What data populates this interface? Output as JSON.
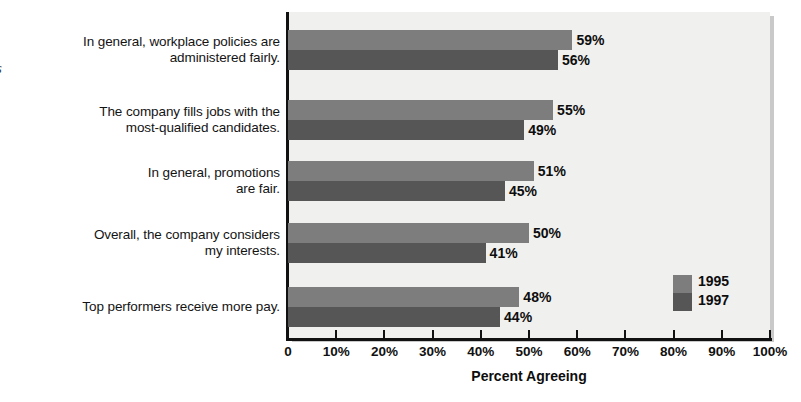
{
  "chart_data": {
    "type": "bar",
    "orientation": "horizontal",
    "title": "",
    "xlabel": "Percent Agreeing",
    "ylabel": "",
    "xlim": [
      0,
      100
    ],
    "grid": false,
    "legend_position": "inside-bottom-right",
    "categories": [
      "In general, workplace policies are administered fairly.",
      "The company fills jobs with the most-qualified candidates.",
      "In general, promotions are fair.",
      "Overall, the company considers my interests.",
      "Top performers receive more pay."
    ],
    "series": [
      {
        "name": "1995",
        "color": "#7d7d7d",
        "values": [
          59,
          55,
          51,
          50,
          48
        ]
      },
      {
        "name": "1997",
        "color": "#565656",
        "values": [
          56,
          49,
          45,
          41,
          44
        ]
      }
    ],
    "value_labels": [
      [
        "59%",
        "55%",
        "51%",
        "50%",
        "48%"
      ],
      [
        "56%",
        "49%",
        "45%",
        "41%",
        "44%"
      ]
    ],
    "tick_labels": [
      "0",
      "10%",
      "20%",
      "30%",
      "40%",
      "50%",
      "60%",
      "70%",
      "80%",
      "90%",
      "100%"
    ],
    "tick_values": [
      0,
      10,
      20,
      30,
      40,
      50,
      60,
      70,
      80,
      90,
      100
    ]
  },
  "category_lines": [
    [
      "In general, workplace policies are",
      "administered fairly."
    ],
    [
      "The company fills jobs with the",
      "most-qualified candidates."
    ],
    [
      "In general, promotions",
      "are fair."
    ],
    [
      "Overall, the company considers",
      "my interests."
    ],
    [
      "Top performers receive more pay."
    ]
  ],
  "edge_glyph": "s",
  "legend": {
    "items": [
      {
        "label": "1995",
        "color": "#7d7d7d"
      },
      {
        "label": "1997",
        "color": "#565656"
      }
    ]
  },
  "axis": {
    "x_title": "Percent Agreeing"
  },
  "colors": {
    "plot_background": "#f0f0ee",
    "page_background": "#ffffff",
    "axis": "#111111",
    "series_1995": "#7d7d7d",
    "series_1997": "#565656"
  }
}
